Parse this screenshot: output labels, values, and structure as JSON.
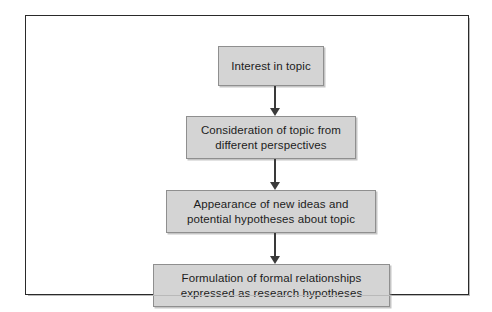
{
  "figure": {
    "type": "flowchart",
    "orientation": "vertical-top-to-bottom",
    "background_color": "#ffffff",
    "frame_border_color": "#2a2a2a",
    "node_fill_color": "#d4d4d4",
    "node_border_color": "#8f8f8f",
    "connector_color": "#3a3a3a",
    "nodes": [
      {
        "id": "box-1",
        "label": "Interest in topic",
        "lines": [
          "Interest in topic"
        ]
      },
      {
        "id": "box-2",
        "label": "Consideration of topic from different perspectives",
        "lines": [
          "Consideration of topic from",
          "different perspectives"
        ]
      },
      {
        "id": "box-3",
        "label": "Appearance of new ideas and potential hypotheses about topic",
        "lines": [
          "Appearance of new ideas and",
          "potential hypotheses about topic"
        ]
      },
      {
        "id": "box-4",
        "label": "Formulation of formal relationships expressed as research hypotheses",
        "lines": [
          "Formulation of formal relationships",
          "expressed as research hypotheses"
        ]
      }
    ],
    "connectors": [
      {
        "id": "connector-1",
        "from": "box-1",
        "to": "box-2",
        "arrow": "down-arrow"
      },
      {
        "id": "connector-2",
        "from": "box-2",
        "to": "box-3",
        "arrow": "down-arrow"
      },
      {
        "id": "connector-3",
        "from": "box-3",
        "to": "box-4",
        "arrow": "down-arrow"
      }
    ],
    "text": {
      "box_1_text": "Interest in topic",
      "box_2_text": "Consideration of topic from\ndifferent perspectives",
      "box_3_text": "Appearance of new ideas and\npotential hypotheses about topic",
      "box_4_text": "Formulation of formal relationships\nexpressed as research hypotheses"
    }
  }
}
